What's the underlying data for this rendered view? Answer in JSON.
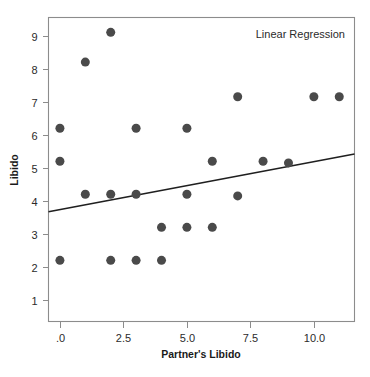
{
  "chart_data": {
    "type": "scatter",
    "title": "",
    "annotation": "Linear Regression",
    "xlabel": "Partner's Libido",
    "ylabel": "Libido",
    "xlim": [
      -0.45,
      11.6
    ],
    "ylim": [
      0.35,
      9.55
    ],
    "grid": false,
    "legend_position": "none",
    "xticks": [
      0,
      2.5,
      5,
      7.5,
      10
    ],
    "xtick_labels": [
      ".0",
      "2.5",
      "5.0",
      "7.5",
      "10.0"
    ],
    "yticks": [
      1,
      2,
      3,
      4,
      5,
      6,
      7,
      8,
      9
    ],
    "ytick_labels": [
      "1",
      "2",
      "3",
      "4",
      "5",
      "6",
      "7",
      "8",
      "9"
    ],
    "marker": {
      "shape": "circle",
      "color": "#4a4a4a",
      "size_px": 9
    },
    "points": [
      {
        "x": 0,
        "y": 6.2
      },
      {
        "x": 0,
        "y": 5.2
      },
      {
        "x": 0,
        "y": 2.2
      },
      {
        "x": 1,
        "y": 8.2
      },
      {
        "x": 1,
        "y": 4.2
      },
      {
        "x": 2,
        "y": 9.1
      },
      {
        "x": 2,
        "y": 4.2
      },
      {
        "x": 2,
        "y": 2.2
      },
      {
        "x": 3,
        "y": 6.2
      },
      {
        "x": 3,
        "y": 4.2
      },
      {
        "x": 3,
        "y": 2.2
      },
      {
        "x": 4,
        "y": 3.2
      },
      {
        "x": 4,
        "y": 2.2
      },
      {
        "x": 5,
        "y": 6.2
      },
      {
        "x": 5,
        "y": 4.2
      },
      {
        "x": 5,
        "y": 3.2
      },
      {
        "x": 6,
        "y": 5.2
      },
      {
        "x": 6,
        "y": 3.2
      },
      {
        "x": 7,
        "y": 7.15
      },
      {
        "x": 7,
        "y": 4.15
      },
      {
        "x": 8,
        "y": 5.2
      },
      {
        "x": 9,
        "y": 5.15
      },
      {
        "x": 10,
        "y": 7.15
      },
      {
        "x": 11,
        "y": 7.15
      }
    ],
    "fit_line": {
      "label": "Linear Regression",
      "color": "#1f1f1f",
      "width_px": 1.6,
      "x_start": -0.45,
      "y_start": 3.67,
      "x_end": 11.6,
      "y_end": 5.42
    }
  }
}
